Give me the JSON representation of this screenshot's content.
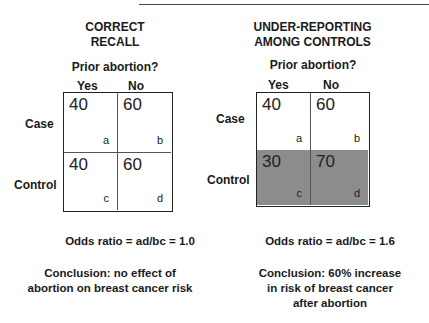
{
  "left_panel": {
    "title_line1": "CORRECT",
    "title_line2": "RECALL",
    "question": "Prior abortion?",
    "col_yes": "Yes",
    "col_no": "No",
    "row_case": "Case",
    "row_control": "Control",
    "cells": {
      "a": {
        "value": "40",
        "label": "a"
      },
      "b": {
        "value": "60",
        "label": "b"
      },
      "c": {
        "value": "40",
        "label": "c"
      },
      "d": {
        "value": "60",
        "label": "d"
      }
    },
    "odds_ratio": "Odds ratio = ad/bc = 1.0",
    "conclusion_line1": "Conclusion: no effect of",
    "conclusion_line2": "abortion on breast cancer risk"
  },
  "right_panel": {
    "title_line1": "UNDER-REPORTING",
    "title_line2": "AMONG CONTROLS",
    "question": "Prior abortion?",
    "col_yes": "Yes",
    "col_no": "No",
    "row_case": "Case",
    "row_control": "Control",
    "cells": {
      "a": {
        "value": "40",
        "label": "a"
      },
      "b": {
        "value": "60",
        "label": "b"
      },
      "c": {
        "value": "30",
        "label": "c"
      },
      "d": {
        "value": "70",
        "label": "d"
      }
    },
    "odds_ratio": "Odds ratio = ad/bc = 1.6",
    "conclusion_line1": "Conclusion: 60% increase",
    "conclusion_line2": "in risk of breast cancer",
    "conclusion_line3": "after abortion"
  },
  "colors": {
    "shaded_cell": "#8c8c8c",
    "border": "#222222"
  }
}
